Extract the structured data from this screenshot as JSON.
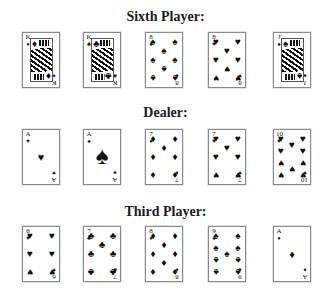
{
  "hands": [
    {
      "title": "Sixth Player:",
      "cards": [
        {
          "rank": "K",
          "suit": "♦",
          "suit_name": "diamonds",
          "label": "King of Diamonds"
        },
        {
          "rank": "K",
          "suit": "♣",
          "suit_name": "clubs",
          "label": "King of Clubs"
        },
        {
          "rank": "8",
          "suit": "♠",
          "suit_name": "spades",
          "label": "8 of Spades"
        },
        {
          "rank": "8",
          "suit": "♥",
          "suit_name": "hearts",
          "label": "8 of Hearts"
        },
        {
          "rank": "J",
          "suit": "♠",
          "suit_name": "spades",
          "label": "Jack of Spades"
        }
      ]
    },
    {
      "title": "Dealer:",
      "cards": [
        {
          "rank": "A",
          "suit": "♥",
          "suit_name": "hearts",
          "label": "Ace of Hearts"
        },
        {
          "rank": "A",
          "suit": "♠",
          "suit_name": "spades",
          "label": "Ace of Spades"
        },
        {
          "rank": "7",
          "suit": "♦",
          "suit_name": "diamonds",
          "label": "7 of Diamonds"
        },
        {
          "rank": "7",
          "suit": "♥",
          "suit_name": "hearts",
          "label": "7 of Hearts"
        },
        {
          "rank": "10",
          "suit": "♥",
          "suit_name": "hearts",
          "label": "10 of Hearts"
        }
      ]
    },
    {
      "title": "Third Player:",
      "cards": [
        {
          "rank": "6",
          "suit": "♥",
          "suit_name": "hearts",
          "label": "6 of Hearts"
        },
        {
          "rank": "7",
          "suit": "♣",
          "suit_name": "clubs",
          "label": "7 of Clubs"
        },
        {
          "rank": "8",
          "suit": "♦",
          "suit_name": "diamonds",
          "label": "8 of Diamonds"
        },
        {
          "rank": "9",
          "suit": "♠",
          "suit_name": "spades",
          "label": "9 of Spades"
        },
        {
          "rank": "A",
          "suit": "♦",
          "suit_name": "diamonds",
          "label": "Ace of Diamonds"
        }
      ]
    }
  ]
}
